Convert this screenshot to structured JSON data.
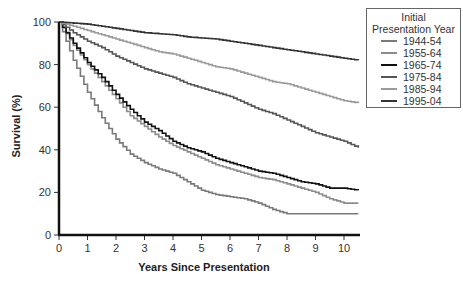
{
  "chart_data": {
    "type": "line",
    "title": "",
    "xlabel": "Years Since Presentation",
    "ylabel": "Survival (%)",
    "xlim": [
      0,
      10.5
    ],
    "ylim": [
      0,
      100
    ],
    "x_ticks": [
      "0",
      "1",
      "2",
      "3",
      "4",
      "5",
      "6",
      "7",
      "8",
      "9",
      "10"
    ],
    "y_ticks": [
      "0",
      "20",
      "40",
      "60",
      "80",
      "100"
    ],
    "grid": false,
    "legend_position": "right",
    "legend_title": "Initial Presentation Year",
    "x": [
      0,
      0.5,
      1,
      1.5,
      2,
      2.5,
      3,
      3.5,
      4,
      4.5,
      5,
      5.5,
      6,
      6.5,
      7,
      7.5,
      8,
      8.5,
      9,
      9.5,
      10,
      10.5
    ],
    "series": [
      {
        "name": "1944-54",
        "color": "#7a7a7a",
        "values": [
          100,
          82,
          67,
          55,
          45,
          38,
          34,
          31,
          29,
          25,
          21,
          19,
          18,
          17,
          15,
          12,
          10,
          10,
          10,
          10,
          10,
          10
        ]
      },
      {
        "name": "1955-64",
        "color": "#8c8c8c",
        "values": [
          100,
          89,
          80,
          72,
          64,
          56,
          51,
          46,
          42,
          39,
          36,
          33,
          31,
          29,
          27,
          26,
          24,
          22,
          20,
          17,
          15,
          15
        ]
      },
      {
        "name": "1965-74",
        "color": "#111111",
        "values": [
          100,
          90,
          81,
          74,
          66,
          59,
          53,
          49,
          44,
          41,
          39,
          36,
          34,
          32,
          30,
          29,
          27,
          25,
          24,
          22,
          22,
          21
        ]
      },
      {
        "name": "1975-84",
        "color": "#555555",
        "values": [
          100,
          95,
          91,
          88,
          84,
          81,
          78,
          76,
          74,
          71,
          69,
          67,
          65,
          62,
          59,
          57,
          54,
          51,
          48,
          46,
          44,
          41
        ]
      },
      {
        "name": "1985-94",
        "color": "#9a9a9a",
        "values": [
          100,
          98,
          96,
          94,
          92,
          90,
          88,
          86,
          85,
          83,
          81,
          79,
          78,
          76,
          74,
          72,
          71,
          69,
          67,
          65,
          63,
          62
        ]
      },
      {
        "name": "1995-04",
        "color": "#333333",
        "values": [
          100,
          99.5,
          99,
          98,
          97,
          96,
          95,
          94.5,
          94,
          93,
          92.5,
          92,
          91,
          90,
          89,
          88,
          87,
          86,
          85,
          84,
          83,
          82
        ]
      }
    ]
  },
  "legend": {
    "title_line1": "Initial",
    "title_line2": "Presentation Year",
    "items": [
      "1944-54",
      "1955-64",
      "1965-74",
      "1975-84",
      "1985-94",
      "1995-04"
    ]
  },
  "axes": {
    "xlabel": "Years Since Presentation",
    "ylabel": "Survival (%)"
  }
}
